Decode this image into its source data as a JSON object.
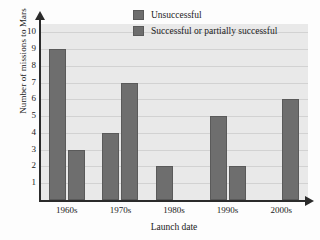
{
  "chart_data": {
    "type": "bar",
    "title": "",
    "xlabel": "Launch date",
    "ylabel": "Number of missions to Mars",
    "categories": [
      "1960s",
      "1970s",
      "1980s",
      "1990s",
      "2000s"
    ],
    "series": [
      {
        "name": "Unsuccessful",
        "values": [
          9,
          4,
          2,
          5,
          0
        ],
        "color": "#6e6e6e"
      },
      {
        "name": "Successful or partially successful",
        "values": [
          3,
          7,
          0,
          2,
          6
        ],
        "color": "#6e6e6e"
      }
    ],
    "ylim": [
      0,
      10.5
    ],
    "yticks": [
      1,
      2,
      3,
      4,
      5,
      6,
      7,
      8,
      9,
      10
    ],
    "grid": true,
    "legend_position": "top-right",
    "plot_background": "#e9e9e9",
    "gridline_color": "#d2d2d2",
    "axis_color": "#2b2b2b"
  },
  "legend": {
    "items": [
      {
        "label": "Unsuccessful"
      },
      {
        "label": "Successful or partially successful"
      }
    ]
  },
  "axes": {
    "y_title": "Number of missions to Mars",
    "x_title": "Launch date"
  }
}
